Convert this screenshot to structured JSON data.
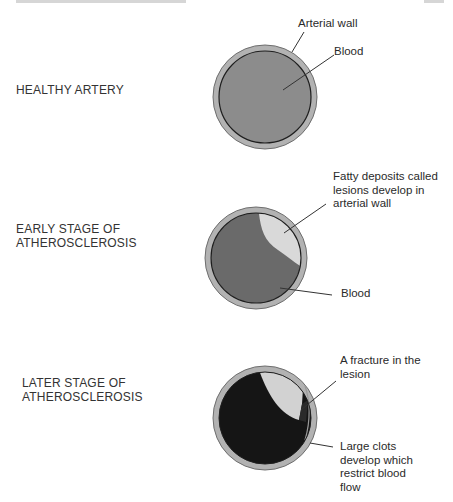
{
  "colors": {
    "wall": "#b2b2b2",
    "wall_outline": "#6e6e6e",
    "healthy_blood": "#8c8c8c",
    "early_blood": "#6a6a6a",
    "lesion": "#d9d9d9",
    "clot": "#151515",
    "leader_line": "#333333"
  },
  "stages": [
    {
      "label": "HEALTHY ARTERY",
      "callouts": [
        {
          "text": "Arterial wall"
        },
        {
          "text": "Blood"
        }
      ]
    },
    {
      "label": "EARLY STAGE OF\nATHEROSCLEROSIS",
      "callouts": [
        {
          "text": "Fatty deposits called\nlesions develop in\narterial wall"
        },
        {
          "text": "Blood"
        }
      ]
    },
    {
      "label": "LATER STAGE OF\nATHEROSCLEROSIS",
      "callouts": [
        {
          "text": "A fracture in the\nlesion"
        },
        {
          "text": "Large clots\ndevelop which\nrestrict blood\nflow"
        }
      ]
    }
  ]
}
